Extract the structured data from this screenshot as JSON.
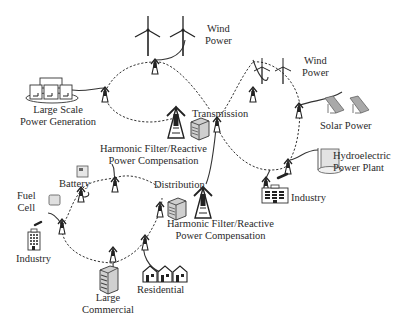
{
  "diagram": {
    "type": "smart-grid-network",
    "labels": {
      "wind_power_top": {
        "line1": "Wind",
        "line2": "Power"
      },
      "wind_power_right": {
        "line1": "Wind",
        "line2": "Power"
      },
      "large_scale_generation": {
        "line1": "Large Scale",
        "line2": "Power Generation"
      },
      "transmission": "Transmission",
      "harmonic_filter_top": {
        "line1": "Harmonic Filter/Reactive",
        "line2": "Power Compensation"
      },
      "solar_power": "Solar Power",
      "hydroelectric": {
        "line1": "Hydroelectric",
        "line2": "Power Plant"
      },
      "industry_right": "Industry",
      "battery": "Battery",
      "fuel_cell": {
        "line1": "Fuel",
        "line2": "Cell"
      },
      "distribution": "Distribution",
      "harmonic_filter_bottom": {
        "line1": "Harmonic Filter/Reactive",
        "line2": "Power Compensation"
      },
      "industry_left": "Industry",
      "residential": "Residential",
      "large_commercial": {
        "line1": "Large",
        "line2": "Commercial"
      }
    },
    "colors": {
      "line": "#333333",
      "icon_fill": "#d8d8d8",
      "solar_fill": "#a9a9a9",
      "text": "#2a2a2a"
    }
  }
}
